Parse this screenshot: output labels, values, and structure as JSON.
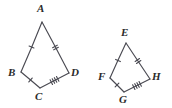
{
  "figure": {
    "type": "geometry-diagram",
    "background_color": "#ffffff",
    "stroke_color": "#4a4a52",
    "label_color": "#2b2b2b",
    "shapes": [
      {
        "id": "quadrilateral-abcd",
        "name": "quadrilateral-abcd",
        "vertices": [
          {
            "label": "A",
            "x": 42,
            "y": 22,
            "label_x": 37,
            "label_y": 3
          },
          {
            "label": "B",
            "x": 21,
            "y": 72,
            "label_x": 8,
            "label_y": 67
          },
          {
            "label": "C",
            "x": 40,
            "y": 88,
            "label_x": 35,
            "label_y": 91
          },
          {
            "label": "D",
            "x": 69,
            "y": 73,
            "label_x": 71,
            "label_y": 67
          }
        ],
        "sides": [
          {
            "name": "side-ab",
            "from": "A",
            "to": "B",
            "ticks": 1
          },
          {
            "name": "side-bc",
            "from": "B",
            "to": "C",
            "ticks": 1
          },
          {
            "name": "side-cd",
            "from": "C",
            "to": "D",
            "ticks": 4
          },
          {
            "name": "side-da",
            "from": "D",
            "to": "A",
            "ticks": 2
          }
        ]
      },
      {
        "id": "quadrilateral-efgh",
        "name": "quadrilateral-efgh",
        "vertices": [
          {
            "label": "E",
            "x": 126,
            "y": 43,
            "label_x": 121,
            "label_y": 27
          },
          {
            "label": "F",
            "x": 110,
            "y": 78,
            "label_x": 98,
            "label_y": 71
          },
          {
            "label": "G",
            "x": 124,
            "y": 92,
            "label_x": 119,
            "label_y": 94
          },
          {
            "label": "H",
            "x": 150,
            "y": 79,
            "label_x": 152,
            "label_y": 71
          }
        ],
        "sides": [
          {
            "name": "side-ef",
            "from": "E",
            "to": "F",
            "ticks": 1
          },
          {
            "name": "side-fg",
            "from": "F",
            "to": "G",
            "ticks": 1
          },
          {
            "name": "side-gh",
            "from": "G",
            "to": "H",
            "ticks": 4
          },
          {
            "name": "side-he",
            "from": "H",
            "to": "E",
            "ticks": 2
          }
        ]
      }
    ]
  }
}
